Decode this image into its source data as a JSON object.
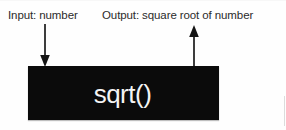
{
  "diagram": {
    "background_color": "#fefefe",
    "labels": {
      "input": "Input: number",
      "output": "Output: square root of number"
    },
    "process_block": {
      "label": "sqrt()",
      "fill_color": "#0b0b0b",
      "text_color": "#f4f4f4"
    },
    "arrows": {
      "input": {
        "name": "input-arrow",
        "direction": "down",
        "color": "#3d3d3d"
      },
      "output": {
        "name": "output-arrow",
        "direction": "up",
        "color": "#3d3d3d"
      }
    }
  }
}
